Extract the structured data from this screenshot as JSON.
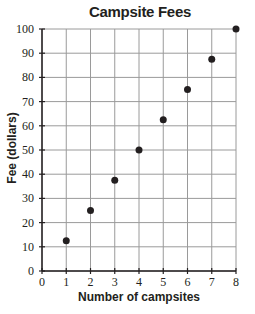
{
  "chart_data": {
    "type": "scatter",
    "title": "Campsite Fees",
    "xlabel": "Number of campsites",
    "ylabel": "Fee (dollars)",
    "x": [
      1,
      2,
      3,
      4,
      5,
      6,
      7,
      8
    ],
    "y": [
      12.5,
      25,
      37.5,
      50,
      62.5,
      75,
      87.5,
      100
    ],
    "xlim": [
      0,
      8
    ],
    "ylim": [
      0,
      100
    ],
    "xticks": [
      "0",
      "1",
      "2",
      "3",
      "4",
      "5",
      "6",
      "7",
      "8"
    ],
    "yticks": [
      "0",
      "10",
      "20",
      "30",
      "40",
      "50",
      "60",
      "70",
      "80",
      "90",
      "100"
    ],
    "grid": true,
    "legend": null
  },
  "colors": {
    "grid": "#9a9a9a",
    "axis": "#231f20",
    "point": "#231f20"
  }
}
